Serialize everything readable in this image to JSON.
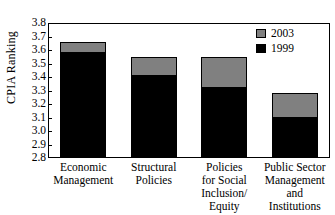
{
  "chart_data": {
    "type": "bar",
    "stacked": true,
    "title": "",
    "xlabel": "",
    "ylabel": "CPIA Ranking",
    "ylim": [
      2.8,
      3.8
    ],
    "ytick_step": 0.1,
    "ytick_labels": [
      "3.8",
      "3.7",
      "3.6",
      "3.5",
      "3.4",
      "3.3",
      "3.2",
      "3.1",
      "3.0",
      "2.9",
      "2.8"
    ],
    "ytick_values": [
      3.8,
      3.7,
      3.6,
      3.5,
      3.4,
      3.3,
      3.2,
      3.1,
      3.0,
      2.9,
      2.8
    ],
    "grid": false,
    "legend_position": "top-right",
    "categories": [
      "Economic\nManagement",
      "Structural\nPolicies",
      "Policies\nfor Social\nInclusion/\nEquity",
      "Public Sector\nManagement\nand\nInstitutions"
    ],
    "series": [
      {
        "name": "1999",
        "color": "#000000",
        "values": [
          3.58,
          3.41,
          3.315,
          3.1
        ]
      },
      {
        "name": "2003",
        "color": "#808080",
        "values": [
          3.66,
          3.545,
          3.55,
          3.28
        ]
      }
    ]
  },
  "legend": {
    "entries": [
      {
        "label": "2003",
        "color": "#808080"
      },
      {
        "label": "1999",
        "color": "#000000"
      }
    ]
  },
  "axis": {
    "y_title": "CPIA Ranking"
  }
}
